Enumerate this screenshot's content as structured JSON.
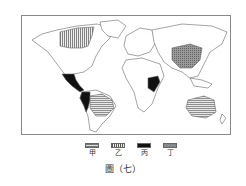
{
  "map": {
    "description": "World map with four shaded regions",
    "colors": {
      "jia": "#9a9a9a",
      "yi": "#c8c8c8",
      "bing": "#111111",
      "ding": "#8a8a8a",
      "outline": "#666666"
    }
  },
  "legend": {
    "items": [
      {
        "key": "jia",
        "label": "甲",
        "pattern": "horizontal-lines"
      },
      {
        "key": "yi",
        "label": "乙",
        "pattern": "vertical-lines"
      },
      {
        "key": "bing",
        "label": "丙",
        "pattern": "solid-black"
      },
      {
        "key": "ding",
        "label": "丁",
        "pattern": "dotted-grey"
      }
    ]
  },
  "caption": "圖（七）"
}
